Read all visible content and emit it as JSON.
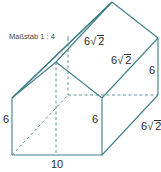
{
  "title": "Maßstab 1 : 4",
  "colors": {
    "edge": "#3f7f86",
    "hidden": "#4a8a90",
    "text": "#2a2a2a"
  },
  "labels": {
    "roof_left": {
      "coef": "6",
      "radicand": "2"
    },
    "roof_mid": {
      "coef": "6",
      "radicand": "2"
    },
    "back_height": "6",
    "front_height_right": "6",
    "front_height_left": "6",
    "depth_bottom": {
      "coef": "6",
      "radicand": "2"
    },
    "width_bottom": "10"
  },
  "shape": {
    "type": "pentagonal prism (house shape)",
    "front_face": [
      [
        12,
        155
      ],
      [
        102,
        155
      ],
      [
        102,
        98
      ],
      [
        56,
        62
      ],
      [
        12,
        98
      ]
    ],
    "back_visible": [
      [
        112,
        2
      ],
      [
        158,
        38
      ],
      [
        158,
        95
      ]
    ],
    "hidden_back": [
      [
        68,
        95
      ],
      [
        68,
        38
      ]
    ]
  }
}
